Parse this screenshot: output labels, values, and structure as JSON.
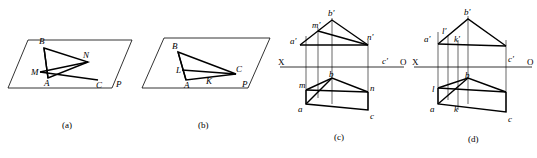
{
  "figure": {
    "title_captions": [
      "(a)",
      "(b)",
      "(c)",
      "(d)"
    ],
    "panels": [
      {
        "id": "a",
        "caption": "(a)",
        "labels": [
          "B",
          "N",
          "M",
          "A",
          "C",
          "P"
        ]
      },
      {
        "id": "b",
        "caption": "(b)",
        "labels": [
          "B",
          "L",
          "A",
          "K",
          "C",
          "P"
        ]
      },
      {
        "id": "c",
        "caption": "(c)",
        "labels": [
          "b'",
          "m'",
          "n'",
          "a'",
          "X",
          "O",
          "c'",
          "m",
          "b",
          "n",
          "a",
          "c"
        ],
        "axis_left": "X",
        "axis_right": "O"
      },
      {
        "id": "d",
        "caption": "(d)",
        "labels": [
          "b'",
          "l'",
          "k'",
          "a'",
          "X",
          "O",
          "c'",
          "l",
          "b",
          "k",
          "a",
          "c"
        ],
        "axis_left": "X",
        "axis_right": "O"
      }
    ]
  },
  "colors": {
    "stroke": "#000000",
    "background": "#ffffff"
  }
}
